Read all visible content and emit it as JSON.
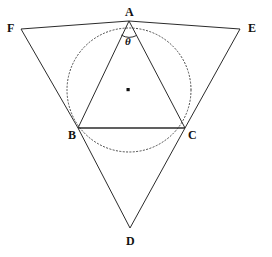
{
  "figure": {
    "background_color": "#ffffff",
    "stroke_color": "#2b2b2b",
    "dotted_stroke_color": "#4a4a4a",
    "label_color": "#111111",
    "width": 272,
    "height": 257
  },
  "labels": {
    "A": "A",
    "B": "B",
    "C": "C",
    "D": "D",
    "E": "E",
    "F": "F",
    "theta": "θ"
  },
  "points": {
    "A": {
      "name": "A",
      "x": 129,
      "y": 21
    },
    "B": {
      "name": "B",
      "x": 78,
      "y": 128
    },
    "C": {
      "name": "C",
      "x": 185,
      "y": 128
    },
    "D": {
      "name": "D",
      "x": 130,
      "y": 228
    },
    "E": {
      "name": "E",
      "x": 240,
      "y": 29
    },
    "F": {
      "name": "F",
      "x": 21,
      "y": 29
    },
    "O": {
      "name": "center-dot",
      "x": 128,
      "y": 90
    }
  },
  "label_positions": {
    "A": {
      "x": 125,
      "y": 6
    },
    "B": {
      "x": 68,
      "y": 129
    },
    "C": {
      "x": 188,
      "y": 129
    },
    "D": {
      "x": 126,
      "y": 235
    },
    "E": {
      "x": 248,
      "y": 22
    },
    "F": {
      "x": 7,
      "y": 22
    },
    "theta": {
      "x": 125,
      "y": 36
    }
  },
  "circle": {
    "name": "circumcircle",
    "cx": 129,
    "cy": 90,
    "r": 62,
    "style": "dotted"
  },
  "angle_arc": {
    "name": "angle-theta-at-A",
    "vertex": "A",
    "radius": 16,
    "label": "θ"
  },
  "segments": [
    {
      "name": "segment-AB",
      "from": "A",
      "to": "B"
    },
    {
      "name": "segment-AC",
      "from": "A",
      "to": "C"
    },
    {
      "name": "segment-BC",
      "from": "B",
      "to": "C"
    },
    {
      "name": "segment-FA",
      "from": "F",
      "to": "A"
    },
    {
      "name": "segment-AE",
      "from": "A",
      "to": "E"
    },
    {
      "name": "segment-FB",
      "from": "F",
      "to": "B"
    },
    {
      "name": "segment-BD",
      "from": "B",
      "to": "D"
    },
    {
      "name": "segment-EC",
      "from": "E",
      "to": "C"
    },
    {
      "name": "segment-CD",
      "from": "C",
      "to": "D"
    }
  ],
  "long_lines": [
    {
      "name": "line-F-to-D",
      "from": "F",
      "to": "D"
    },
    {
      "name": "line-E-to-D",
      "from": "E",
      "to": "D"
    },
    {
      "name": "line-F-to-E",
      "from": "F",
      "to": "E"
    }
  ]
}
